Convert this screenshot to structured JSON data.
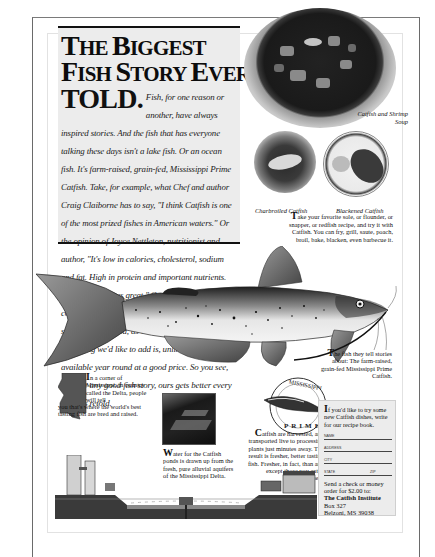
{
  "headline": {
    "line1": [
      "T",
      "HE ",
      "B",
      "IGGEST"
    ],
    "line2": [
      "F",
      "ISH ",
      "S",
      "TORY ",
      "E",
      "VER"
    ],
    "told": "TOLD."
  },
  "body_copy": "Fish, for one reason or another, have always inspired stories. And the fish that has everyone talking these days isn't a lake fish. Or an ocean fish. It's farm-raised, grain-fed, Mississippi Prime Catfish. Take, for example, what Chef and author Craig Claiborne has to say, \"I think Catfish is one of the most prized fishes in American waters.\" Or the opinion of Joyce Nettleton, nutritionist and author, \"It's low in calories, cholesterol, sodium and fat. High in protein and important nutrients. Best of all it tastes great.\" Or food writer and cookbook author Betty Fussell. \"It's as sweet as sole, as firm as cod, as versatile as salmon.\" The only thing we'd like to add is, unlike most fish, it's available year round at a good price. So you see, just like any good fish story, ours gets better every time it's retold.",
  "photos": {
    "soup_caption": "Catfish and Shrimp Soup",
    "charbroiled_caption": "Charbroiled Catfish",
    "blackened_caption": "Blackened Catfish"
  },
  "take_copy": {
    "dropcap": "T",
    "text": "ake your favorite sole, or flounder, or snapper, or redfish recipe, and try it with Catfish. You can fry, grill, saute, poach, broil, bake, blacken, even barbecue it."
  },
  "fish_tell": {
    "dropcap": "T",
    "text": "he fish they tell stories about: The farm-raised, grain-fed Mississippi Prime Catfish."
  },
  "corner_copy": {
    "dropcap": "I",
    "text": "n a corner of Mississippi, in country called the Delta, people will tell",
    "tail": "you that's where the world's best tasting fish are bred and raised."
  },
  "water_copy": {
    "dropcap": "W",
    "text": "ater for the Catfish ponds is drawn up from the fresh, pure alluvial aquifers of the Mississippi Delta."
  },
  "harvest_copy": {
    "dropcap": "C",
    "text": "atfish are harvested, and transported live to processing plants just minutes away. The result is fresher, better tasting fish. Fresher, in fact, than any except those you catch yourself."
  },
  "seal": {
    "top_text": "MISSISSIPPI",
    "bottom_text": "PRIME",
    "ring_text": "FARM-RAISED CATFISH"
  },
  "coupon": {
    "dropcap": "I",
    "intro": "f you'd like to try some new Catfish dishes, write for our recipe book.",
    "fields": {
      "name": "Name",
      "address": "Address",
      "city": "City",
      "state": "State",
      "zip": "Zip"
    },
    "send_text": "Send a check or money order for $2.00 to:",
    "org": "The Catfish Institute",
    "box": "Box 327",
    "city_state": "Belzoni, MS 39038"
  },
  "colors": {
    "paper": "#ffffff",
    "headline_panel": "#ececec",
    "ink": "#111111",
    "frame": "#6a6a6a"
  }
}
